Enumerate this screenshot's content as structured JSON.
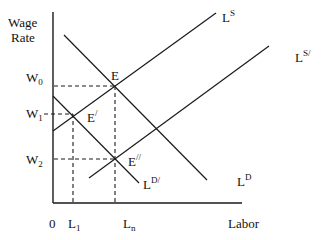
{
  "diagram": {
    "type": "labor-market-supply-demand",
    "y_axis_label_line1": "Wage",
    "y_axis_label_line2": "Rate",
    "x_axis_label": "Labor",
    "origin_label": "0",
    "wage_levels": [
      {
        "base": "W",
        "sub": "0"
      },
      {
        "base": "W",
        "sub": "1"
      },
      {
        "base": "W",
        "sub": "2"
      }
    ],
    "labor_levels": [
      {
        "base": "L",
        "sub": "1"
      },
      {
        "base": "L",
        "sub": "n"
      }
    ],
    "curves": {
      "supply": {
        "base": "L",
        "sup": "S"
      },
      "supply_shifted": {
        "base": "L",
        "sup": "S/"
      },
      "demand": {
        "base": "L",
        "sup": "D"
      },
      "demand_shifted": {
        "base": "L",
        "sup": "D/"
      }
    },
    "equilibria": {
      "e0": {
        "label": "E"
      },
      "e1": {
        "label": "E",
        "mark": "/"
      },
      "e2": {
        "label": "E",
        "mark": "//"
      }
    },
    "colors": {
      "line": "#1a1a1a",
      "background": "#ffffff"
    }
  }
}
